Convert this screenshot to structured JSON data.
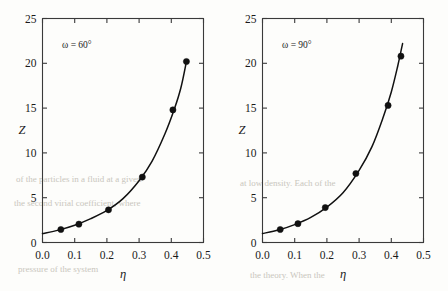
{
  "figure": {
    "background_color": "#fdfdfb",
    "ink_color": "#111111",
    "panel_count": 2
  },
  "bleed_through": {
    "note": "faint ghost text from reverse of scanned page",
    "color": "#c9c6bd",
    "lines": [
      "of the particles in a fluid at a given",
      "the second virial coefficient, where",
      "at low density. Each of the",
      "pressure of the system",
      "the theory. When the"
    ]
  },
  "chart_data": [
    {
      "type": "scatter",
      "panel": "left",
      "title": "",
      "annotation": "ω = 60°",
      "xlabel": "η",
      "ylabel": "Z",
      "xlim": [
        0.0,
        0.5
      ],
      "ylim": [
        0,
        25
      ],
      "xticks": [
        0.0,
        0.1,
        0.2,
        0.3,
        0.4,
        0.5
      ],
      "xtick_labels": [
        "0.0",
        "0.1",
        "0.2",
        "0.3",
        "0.4",
        "0.5"
      ],
      "yticks": [
        0,
        5,
        10,
        15,
        20,
        25
      ],
      "ytick_labels": [
        "0",
        "5",
        "10",
        "15",
        "20",
        "25"
      ],
      "grid": false,
      "legend": "none",
      "tick_direction": "in",
      "series": [
        {
          "name": "simulation points",
          "marker": "filled-circle",
          "x": [
            0.057,
            0.113,
            0.205,
            0.31,
            0.405,
            0.447
          ],
          "y": [
            1.45,
            2.05,
            3.65,
            7.3,
            14.8,
            20.2
          ]
        },
        {
          "name": "theory curve",
          "marker": "none",
          "x": [
            0.0,
            0.05,
            0.1,
            0.15,
            0.2,
            0.25,
            0.3,
            0.34,
            0.38,
            0.41,
            0.43,
            0.447
          ],
          "y": [
            1.0,
            1.38,
            1.92,
            2.66,
            3.58,
            4.9,
            6.9,
            9.05,
            12.1,
            14.95,
            17.3,
            20.2
          ]
        }
      ]
    },
    {
      "type": "scatter",
      "panel": "right",
      "title": "",
      "annotation": "ω = 90°",
      "xlabel": "η",
      "ylabel": "Z",
      "xlim": [
        0.0,
        0.5
      ],
      "ylim": [
        0,
        25
      ],
      "xticks": [
        0.0,
        0.1,
        0.2,
        0.3,
        0.4,
        0.5
      ],
      "xtick_labels": [
        "0.0",
        "0.1",
        "0.2",
        "0.3",
        "0.4",
        "0.5"
      ],
      "yticks": [
        0,
        5,
        10,
        15,
        20,
        25
      ],
      "ytick_labels": [
        "0",
        "5",
        "10",
        "15",
        "20",
        "25"
      ],
      "grid": false,
      "legend": "none",
      "tick_direction": "in",
      "series": [
        {
          "name": "simulation points",
          "marker": "filled-circle",
          "x": [
            0.055,
            0.11,
            0.195,
            0.29,
            0.39,
            0.43
          ],
          "y": [
            1.45,
            2.1,
            3.9,
            7.7,
            15.3,
            20.8
          ]
        },
        {
          "name": "theory curve",
          "marker": "none",
          "x": [
            0.0,
            0.05,
            0.1,
            0.15,
            0.2,
            0.25,
            0.3,
            0.34,
            0.375,
            0.4,
            0.42,
            0.435
          ],
          "y": [
            1.0,
            1.4,
            2.0,
            2.8,
            3.95,
            5.55,
            8.05,
            10.7,
            14.0,
            16.8,
            19.7,
            22.2
          ]
        }
      ]
    }
  ]
}
